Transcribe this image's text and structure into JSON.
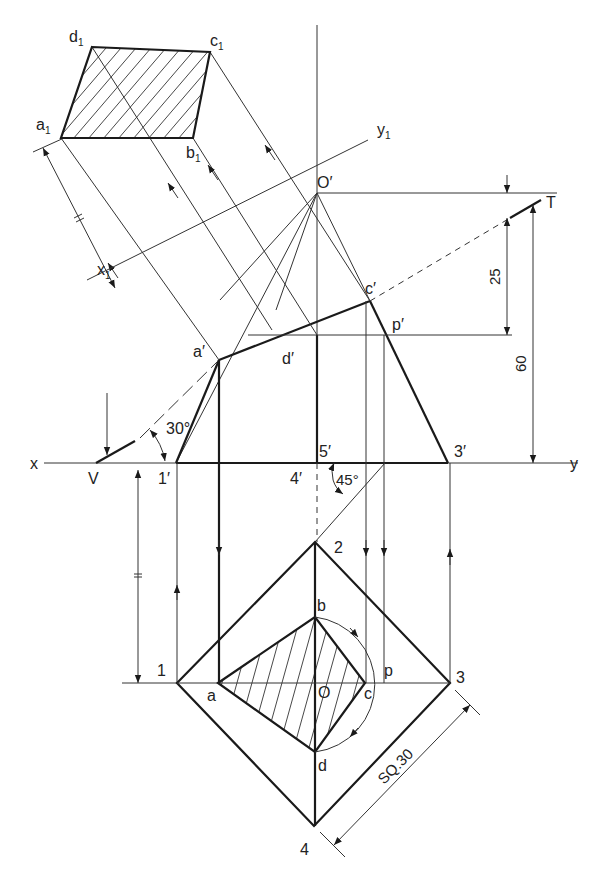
{
  "figure": {
    "type": "orthographic projection — section of square pyramid with auxiliary view of true shape",
    "colors": {
      "line": "#1a1a1a",
      "background": "#ffffff"
    }
  },
  "reference_lines": {
    "xy": {
      "x_label": "x",
      "y_label": "y"
    },
    "x1y1": {
      "x_label": "x",
      "x_sub": "1",
      "y_label": "y",
      "y_sub": "1"
    }
  },
  "cutting_plane": {
    "v_label": "V",
    "t_label": "T",
    "angle": "30°"
  },
  "front_view": {
    "apex": "O′",
    "base_points": [
      "1′",
      "4′",
      "5′",
      "3′"
    ],
    "section_points": [
      "a′",
      "d′",
      "c′",
      "p′"
    ]
  },
  "top_view": {
    "corners": [
      "1",
      "2",
      "3",
      "4"
    ],
    "center": "O",
    "section_points": [
      "a",
      "b",
      "c",
      "d",
      "p"
    ]
  },
  "auxiliary_view": {
    "points": [
      {
        "name": "a",
        "sub": "1"
      },
      {
        "name": "b",
        "sub": "1"
      },
      {
        "name": "c",
        "sub": "1"
      },
      {
        "name": "d",
        "sub": "1"
      }
    ]
  },
  "dimensions": {
    "height_total": "60",
    "cut_height": "25",
    "base_size": "SQ.30",
    "rotation_angle": "45°",
    "equal_mark": "="
  }
}
